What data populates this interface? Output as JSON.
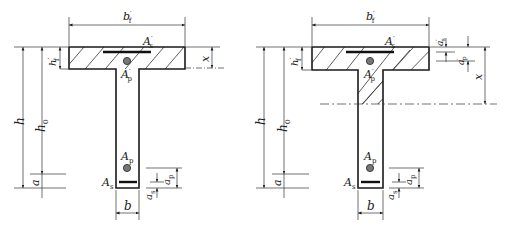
{
  "diagrams": [
    {
      "id": "left",
      "description": "T-section, neutral axis within flange",
      "labels": {
        "flange_width": "b",
        "flange_width_sup": "′",
        "flange_width_sub": "f",
        "flange_thickness": "h",
        "flange_thickness_sup": "′",
        "flange_thickness_sub": "f",
        "total_height": "h",
        "effective_depth": "h",
        "effective_depth_sub": "0",
        "cover": "a",
        "web_width": "b",
        "compression_depth": "x",
        "top_steel": "A",
        "top_steel_sup": "′",
        "top_steel_sub": "s",
        "top_prestress": "A",
        "top_prestress_sup": "′",
        "top_prestress_sub": "p",
        "bottom_prestress": "A",
        "bottom_prestress_sub": "p",
        "bottom_steel": "A",
        "bottom_steel_sub": "s",
        "prestress_cover": "a",
        "prestress_cover_sub": "p",
        "steel_cover": "a",
        "steel_cover_sub": "s"
      }
    },
    {
      "id": "right",
      "description": "T-section, neutral axis within web",
      "labels": {
        "flange_width": "b",
        "flange_width_sup": "′",
        "flange_width_sub": "f",
        "flange_thickness": "h",
        "flange_thickness_sup": "′",
        "flange_thickness_sub": "f",
        "total_height": "h",
        "effective_depth": "h",
        "effective_depth_sub": "0",
        "cover": "a",
        "web_width": "b",
        "compression_depth": "x",
        "top_steel": "A",
        "top_steel_sup": "′",
        "top_steel_sub": "s",
        "top_prestress": "A",
        "top_prestress_sup": "′",
        "top_prestress_sub": "p",
        "bottom_prestress": "A",
        "bottom_prestress_sub": "p",
        "bottom_steel": "A",
        "bottom_steel_sub": "s",
        "prestress_cover": "a",
        "prestress_cover_sub": "p",
        "steel_cover": "a",
        "steel_cover_sub": "s",
        "top_steel_cover": "a",
        "top_steel_cover_sup": "′",
        "top_steel_cover_sub": "s",
        "top_prestress_cover": "a",
        "top_prestress_cover_sup": "′",
        "top_prestress_cover_sub": "p"
      }
    }
  ],
  "colors": {
    "line": "#1a1a1a",
    "thin": "#333333",
    "rebar": "#111111",
    "tendon_fill": "#777777"
  }
}
